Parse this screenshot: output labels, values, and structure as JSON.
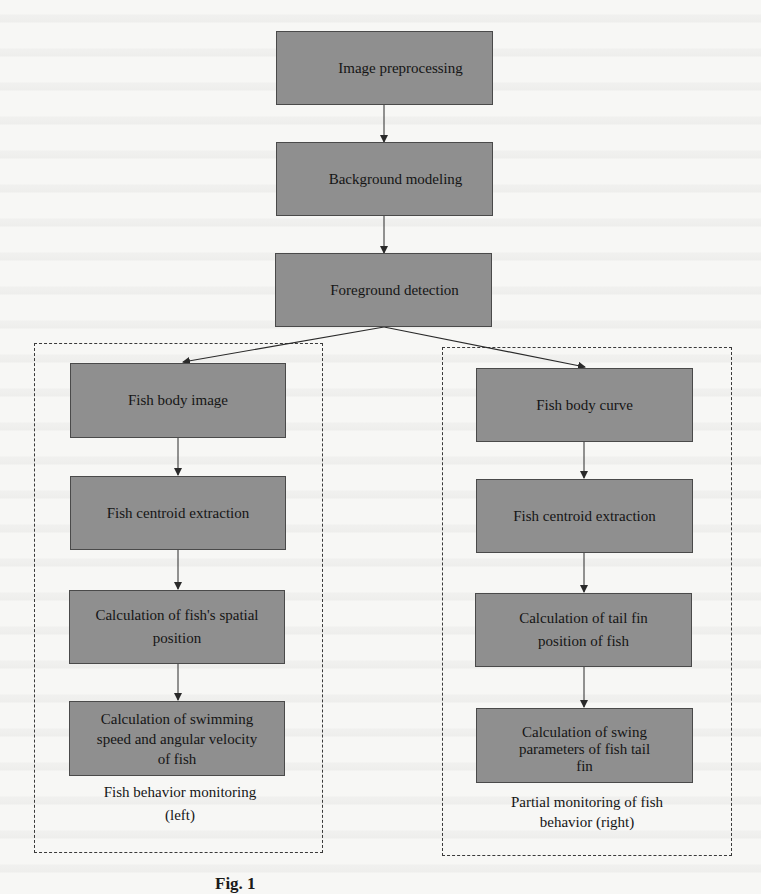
{
  "diagram": {
    "type": "flowchart",
    "colors": {
      "box_fill": "#8f8f8f",
      "box_border": "#4a4a4a",
      "arrow": "#2a2a2a",
      "dashed_group_border": "#3a3a3a",
      "background": "#f7f7f5"
    },
    "main_flow": [
      {
        "id": "image-preprocessing",
        "label": "Image preprocessing"
      },
      {
        "id": "background-modeling",
        "label": "Background modeling"
      },
      {
        "id": "foreground-detection",
        "label": "Foreground detection"
      }
    ],
    "left_branch": {
      "group_label_line1": "Fish behavior monitoring",
      "group_label_line2": "(left)",
      "steps": [
        {
          "id": "fish-body-image",
          "lines": [
            "Fish body image"
          ]
        },
        {
          "id": "fish-centroid-extraction-left",
          "lines": [
            "Fish centroid extraction"
          ]
        },
        {
          "id": "spatial-position",
          "lines": [
            "Calculation of fish's spatial",
            "position"
          ]
        },
        {
          "id": "speed-angular-velocity",
          "lines": [
            "Calculation of swimming",
            "speed and angular velocity",
            "of fish"
          ]
        }
      ]
    },
    "right_branch": {
      "group_label_line1": "Partial monitoring of fish",
      "group_label_line2": "behavior (right)",
      "steps": [
        {
          "id": "fish-body-curve",
          "lines": [
            "Fish body curve"
          ]
        },
        {
          "id": "fish-centroid-extraction-right",
          "lines": [
            "Fish centroid extraction"
          ]
        },
        {
          "id": "tail-fin-position",
          "lines": [
            "Calculation of tail fin",
            "position of fish"
          ]
        },
        {
          "id": "swing-parameters",
          "lines": [
            "Calculation of swing",
            "parameters of fish tail",
            "fin"
          ]
        }
      ]
    },
    "edges": [
      [
        "image-preprocessing",
        "background-modeling"
      ],
      [
        "background-modeling",
        "foreground-detection"
      ],
      [
        "foreground-detection",
        "fish-body-image"
      ],
      [
        "foreground-detection",
        "fish-body-curve"
      ],
      [
        "fish-body-image",
        "fish-centroid-extraction-left"
      ],
      [
        "fish-centroid-extraction-left",
        "spatial-position"
      ],
      [
        "spatial-position",
        "speed-angular-velocity"
      ],
      [
        "fish-body-curve",
        "fish-centroid-extraction-right"
      ],
      [
        "fish-centroid-extraction-right",
        "tail-fin-position"
      ],
      [
        "tail-fin-position",
        "swing-parameters"
      ]
    ],
    "caption": "Fig. 1"
  }
}
